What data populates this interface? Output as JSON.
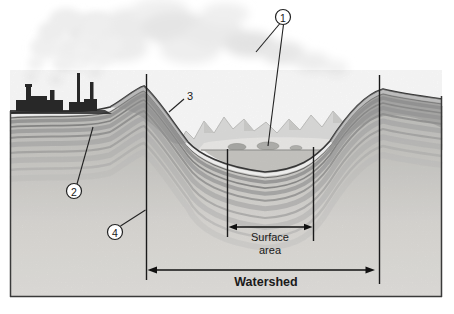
{
  "figure": {
    "callouts": {
      "c1": "1",
      "c2": "2",
      "c3": "3",
      "c4": "4"
    },
    "labels": {
      "surface_area_line1": "Surface",
      "surface_area_line2": "area",
      "watershed": "Watershed"
    },
    "colors": {
      "paper": "#ffffff",
      "ink": "#2a2a2a",
      "terrain_light": "#dcdad6",
      "strata_mid": "#8d8d8d",
      "cloud": "#e8e8e8",
      "factory": "#282828"
    }
  }
}
